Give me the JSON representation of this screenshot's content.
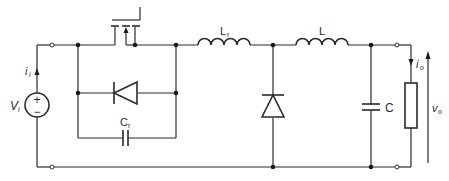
{
  "diagram": {
    "type": "circuit-schematic",
    "components": {
      "source": {
        "label": "V",
        "subscript": "i",
        "polarity_plus": "+",
        "polarity_minus": "−"
      },
      "input_current": {
        "label": "i",
        "subscript": "i"
      },
      "switch": {
        "kind": "MOSFET"
      },
      "antiparallel_diode": {
        "kind": "diode"
      },
      "resonant_capacitor": {
        "label": "C",
        "subscript": "r"
      },
      "resonant_inductor": {
        "label": "L",
        "subscript": "r"
      },
      "freewheel_diode": {
        "kind": "diode"
      },
      "filter_inductor": {
        "label": "L"
      },
      "filter_capacitor": {
        "label": "C"
      },
      "load": {
        "kind": "resistor"
      },
      "output_current": {
        "label": "i",
        "subscript": "o"
      },
      "output_voltage": {
        "label": "v",
        "subscript": "o"
      }
    }
  }
}
